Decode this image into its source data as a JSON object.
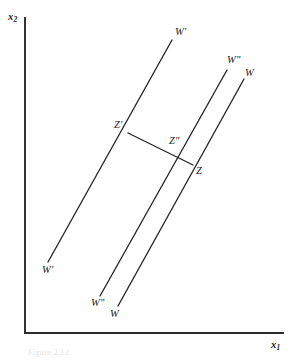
{
  "figure": {
    "type": "economics-indifference-budget-diagram",
    "background_color": "#ffffff",
    "line_color": "#262626",
    "axis_color": "#2b2b2b",
    "axes": {
      "y_label": "x",
      "y_label_sub": "2",
      "x_label": "x",
      "x_label_sub": "1",
      "origin_px": [
        25,
        333
      ],
      "y_top_px": [
        25,
        18
      ],
      "x_right_px": [
        283,
        333
      ]
    },
    "lines": [
      {
        "name": "W-prime-line",
        "label": "W",
        "prime": "′",
        "top_label": "W′",
        "bottom_label": "W′",
        "from_px": [
          48,
          262
        ],
        "to_px": [
          172,
          40
        ]
      },
      {
        "name": "W-double-prime-line",
        "label": "W",
        "prime": "″",
        "top_label": "W″",
        "bottom_label": "W″",
        "from_px": [
          100,
          296
        ],
        "to_px": [
          227,
          70
        ]
      },
      {
        "name": "W-line",
        "label": "W",
        "prime": "",
        "top_label": "W",
        "bottom_label": "W",
        "from_px": [
          118,
          306
        ],
        "to_px": [
          244,
          79
        ]
      }
    ],
    "connector": {
      "name": "Z-prime-to-Z-segment",
      "from_px": [
        128,
        133
      ],
      "to_px": [
        193,
        165
      ]
    },
    "points": [
      {
        "name": "Z-prime",
        "label": "Z′",
        "px": [
          128,
          133
        ],
        "label_px": [
          116,
          120
        ]
      },
      {
        "name": "Z-double-prime",
        "label": "Z″",
        "px": [
          178,
          157
        ],
        "label_px": [
          170,
          136
        ]
      },
      {
        "name": "Z",
        "label": "Z",
        "px": [
          193,
          165
        ],
        "label_px": [
          196,
          166
        ]
      }
    ],
    "labels": {
      "w_prime_top": "W′",
      "w_prime_bottom": "W′",
      "w_dprime_top": "W″",
      "w_dprime_bottom": "W″",
      "w_top": "W",
      "w_bottom": "W",
      "z_prime": "Z′",
      "z_dprime": "Z″",
      "z": "Z"
    },
    "caption": "Figure 2.12"
  }
}
